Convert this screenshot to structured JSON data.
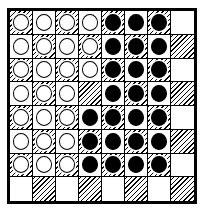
{
  "board": {
    "name": "checkers-board",
    "rows": 8,
    "columns": 8,
    "light_square_color": "#ffffff",
    "dark_square_pattern": "diagonal-hatch",
    "dark_square_hatch_color": "#000000",
    "border_color": "#000000",
    "white_piece_color": "#ffffff",
    "black_piece_color": "#000000",
    "piece_outline_color": "#000000",
    "first_square_shade": "dark",
    "white_piece_count": 25,
    "black_piece_count": 24,
    "empty_square_count": 15,
    "squares": [
      [
        {
          "shade": "dark",
          "piece": "white"
        },
        {
          "shade": "light",
          "piece": "white"
        },
        {
          "shade": "dark",
          "piece": "white"
        },
        {
          "shade": "light",
          "piece": "white"
        },
        {
          "shade": "dark",
          "piece": "black"
        },
        {
          "shade": "light",
          "piece": "black"
        },
        {
          "shade": "dark",
          "piece": "black"
        },
        {
          "shade": "light",
          "piece": "empty"
        }
      ],
      [
        {
          "shade": "light",
          "piece": "white"
        },
        {
          "shade": "dark",
          "piece": "white"
        },
        {
          "shade": "light",
          "piece": "white"
        },
        {
          "shade": "dark",
          "piece": "white"
        },
        {
          "shade": "light",
          "piece": "black"
        },
        {
          "shade": "dark",
          "piece": "black"
        },
        {
          "shade": "light",
          "piece": "black"
        },
        {
          "shade": "dark",
          "piece": "empty"
        }
      ],
      [
        {
          "shade": "dark",
          "piece": "white"
        },
        {
          "shade": "light",
          "piece": "white"
        },
        {
          "shade": "dark",
          "piece": "white"
        },
        {
          "shade": "light",
          "piece": "white"
        },
        {
          "shade": "dark",
          "piece": "black"
        },
        {
          "shade": "light",
          "piece": "black"
        },
        {
          "shade": "dark",
          "piece": "black"
        },
        {
          "shade": "light",
          "piece": "empty"
        }
      ],
      [
        {
          "shade": "light",
          "piece": "white"
        },
        {
          "shade": "dark",
          "piece": "white"
        },
        {
          "shade": "light",
          "piece": "white"
        },
        {
          "shade": "dark",
          "piece": "empty"
        },
        {
          "shade": "light",
          "piece": "black"
        },
        {
          "shade": "dark",
          "piece": "black"
        },
        {
          "shade": "light",
          "piece": "black"
        },
        {
          "shade": "dark",
          "piece": "empty"
        }
      ],
      [
        {
          "shade": "dark",
          "piece": "white"
        },
        {
          "shade": "light",
          "piece": "white"
        },
        {
          "shade": "dark",
          "piece": "white"
        },
        {
          "shade": "light",
          "piece": "black"
        },
        {
          "shade": "dark",
          "piece": "black"
        },
        {
          "shade": "light",
          "piece": "black"
        },
        {
          "shade": "dark",
          "piece": "black"
        },
        {
          "shade": "light",
          "piece": "empty"
        }
      ],
      [
        {
          "shade": "light",
          "piece": "white"
        },
        {
          "shade": "dark",
          "piece": "white"
        },
        {
          "shade": "light",
          "piece": "white"
        },
        {
          "shade": "dark",
          "piece": "black"
        },
        {
          "shade": "light",
          "piece": "black"
        },
        {
          "shade": "dark",
          "piece": "black"
        },
        {
          "shade": "light",
          "piece": "black"
        },
        {
          "shade": "dark",
          "piece": "empty"
        }
      ],
      [
        {
          "shade": "dark",
          "piece": "white"
        },
        {
          "shade": "light",
          "piece": "white"
        },
        {
          "shade": "dark",
          "piece": "white"
        },
        {
          "shade": "light",
          "piece": "black"
        },
        {
          "shade": "dark",
          "piece": "black"
        },
        {
          "shade": "light",
          "piece": "black"
        },
        {
          "shade": "dark",
          "piece": "black"
        },
        {
          "shade": "light",
          "piece": "empty"
        }
      ],
      [
        {
          "shade": "light",
          "piece": "empty"
        },
        {
          "shade": "dark",
          "piece": "empty"
        },
        {
          "shade": "light",
          "piece": "empty"
        },
        {
          "shade": "dark",
          "piece": "empty"
        },
        {
          "shade": "light",
          "piece": "empty"
        },
        {
          "shade": "dark",
          "piece": "empty"
        },
        {
          "shade": "light",
          "piece": "empty"
        },
        {
          "shade": "dark",
          "piece": "empty"
        }
      ]
    ]
  }
}
